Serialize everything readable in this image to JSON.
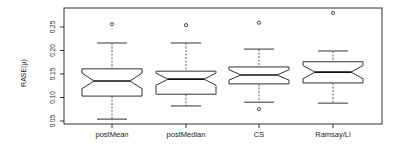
{
  "chart_data": {
    "type": "box",
    "notched": true,
    "title": "",
    "xlabel": "",
    "ylabel": "RASE(μ)",
    "ylim": [
      0.045,
      0.285
    ],
    "yticks": [
      0.05,
      0.1,
      0.15,
      0.2,
      0.25
    ],
    "ytick_labels": [
      "0.05",
      "0.10",
      "0.15",
      "0.20",
      "0.25"
    ],
    "categories": [
      "postMean",
      "postMedian",
      "CS",
      "Ramsay/Li"
    ],
    "series": [
      {
        "name": "postMean",
        "whisker_low": 0.054,
        "q1": 0.103,
        "median": 0.135,
        "q3": 0.161,
        "whisker_high": 0.216,
        "notch_low": 0.119,
        "notch_high": 0.152,
        "outliers": [
          0.256
        ]
      },
      {
        "name": "postMedian",
        "whisker_low": 0.082,
        "q1": 0.107,
        "median": 0.139,
        "q3": 0.156,
        "whisker_high": 0.216,
        "notch_low": 0.126,
        "notch_high": 0.152,
        "outliers": [
          0.254
        ]
      },
      {
        "name": "CS",
        "whisker_low": 0.09,
        "q1": 0.129,
        "median": 0.148,
        "q3": 0.165,
        "whisker_high": 0.203,
        "notch_low": 0.137,
        "notch_high": 0.159,
        "outliers": [
          0.259,
          0.075
        ]
      },
      {
        "name": "Ramsay/Li",
        "whisker_low": 0.088,
        "q1": 0.131,
        "median": 0.154,
        "q3": 0.176,
        "whisker_high": 0.199,
        "notch_low": 0.14,
        "notch_high": 0.168,
        "outliers": [
          0.28
        ]
      }
    ],
    "grid": false,
    "legend": null
  },
  "layout": {
    "frame": {
      "left": 64,
      "top": 8,
      "right": 382,
      "bottom": 124
    },
    "y_px_at_025": 27,
    "px_per_unit": 470,
    "x_centers": [
      112,
      186,
      259,
      333
    ],
    "box_half_width": 30,
    "notch_half_width": 18,
    "cap_half_width": 15,
    "line_color": "#333333"
  }
}
